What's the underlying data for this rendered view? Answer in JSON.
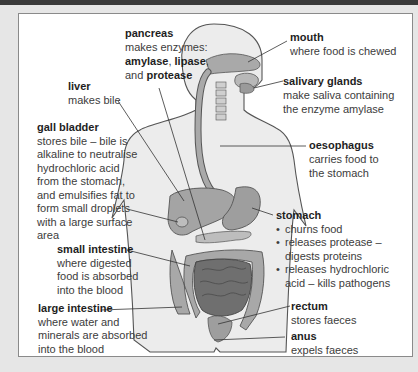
{
  "diagram": {
    "colors": {
      "frame_background": "#e6e6e6",
      "top_band": "#3a3a3a",
      "panel_background": "#ffffff",
      "body_fill": "#e9e9e9",
      "body_outline": "#555555",
      "organ_light": "#b9b9b9",
      "organ_mid": "#9a9a9a",
      "organ_dark": "#6f6f6f",
      "leader_line": "#333333"
    },
    "labels": {
      "pancreas": {
        "title": "pancreas",
        "line1": "makes enzymes:",
        "enzyme1": "amylase",
        "sep1": ", ",
        "enzyme2": "lipase",
        "sep2": ",",
        "and": "and ",
        "enzyme3": "protease"
      },
      "mouth": {
        "title": "mouth",
        "lines": [
          "where food is chewed"
        ]
      },
      "salivary_glands": {
        "title": "salivary glands",
        "lines": [
          "make saliva containing",
          "the enzyme amylase"
        ]
      },
      "liver": {
        "title": "liver",
        "lines": [
          "makes bile"
        ]
      },
      "gall_bladder": {
        "title": "gall bladder",
        "lines": [
          "stores bile – bile is",
          "alkaline to neutralise",
          "hydrochloric acid",
          "from the stomach,",
          "and emulsifies fat to",
          "form small droplets",
          "with a large surface",
          "area"
        ]
      },
      "oesophagus": {
        "title": "oesophagus",
        "lines": [
          "carries food to",
          "the stomach"
        ]
      },
      "stomach": {
        "title": "stomach",
        "bullets": [
          {
            "line1": "churns food",
            "line2": ""
          },
          {
            "line1": "releases protease –",
            "line2": "digests proteins"
          },
          {
            "line1": "releases hydrochloric",
            "line2": "acid – kills pathogens"
          }
        ]
      },
      "small_intestine": {
        "title": "small intestine",
        "lines": [
          "where digested",
          "food is absorbed",
          "into the blood"
        ]
      },
      "large_intestine": {
        "title": "large intestine",
        "lines": [
          "where water and",
          "minerals are absorbed",
          "into the blood"
        ]
      },
      "rectum": {
        "title": "rectum",
        "lines": [
          "stores faeces"
        ]
      },
      "anus": {
        "title": "anus",
        "lines": [
          "expels faeces"
        ]
      }
    }
  }
}
